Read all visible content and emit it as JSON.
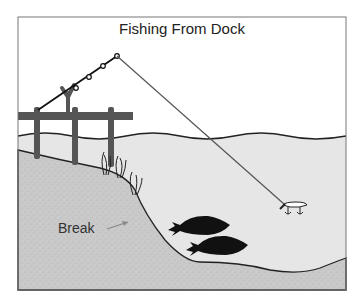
{
  "diagram": {
    "title": "Fishing From Dock",
    "labels": {
      "break": "Break"
    },
    "elements": [
      "dock",
      "fishing-rod",
      "fishing-line",
      "water-surface",
      "shore-bank",
      "weeds",
      "lure",
      "fish"
    ],
    "colors": {
      "water": "#e6e6e6",
      "ground": "#c9c9c9",
      "dock": "#555555",
      "fish": "#111111",
      "outline": "#222222",
      "frame": "#777777"
    }
  }
}
